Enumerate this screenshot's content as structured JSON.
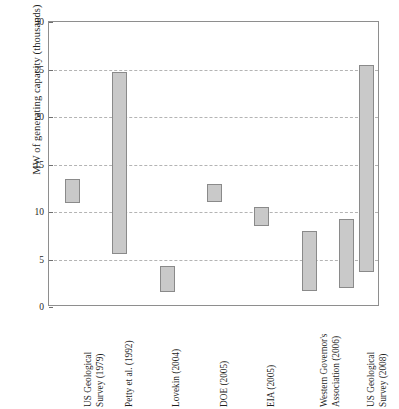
{
  "chart_data": {
    "type": "bar",
    "title": "",
    "xlabel": "",
    "ylabel": "MW of generating capacity (thousands)",
    "ylim": [
      0,
      30
    ],
    "yticks": [
      0,
      5,
      10,
      15,
      20,
      25,
      30
    ],
    "grid": true,
    "legend": "none",
    "note": "Floating range bars: each bar spans a low and high estimate.",
    "categories": [
      "US Geological Survey (1979)",
      "Petty et al. (1992)",
      "Lovekin (2004)",
      "DOE (2005)",
      "EIA (2005)",
      "Western Governor's Association (2006)",
      "US Geological Survey (2008)"
    ],
    "bars": [
      {
        "category": "US Geological Survey (1979)",
        "low": 11.0,
        "high": 13.5
      },
      {
        "category": "Petty et al. (1992)",
        "low": 5.6,
        "high": 24.7
      },
      {
        "category": "Lovekin (2004)",
        "low": 1.6,
        "high": 4.3
      },
      {
        "category": "DOE (2005)",
        "low": 11.1,
        "high": 13.0
      },
      {
        "category": "EIA (2005)",
        "low": 8.5,
        "high": 10.5
      },
      {
        "category": "Western Governor's Association (2006)",
        "low": 1.7,
        "high": 8.0
      },
      {
        "category": "US Geological Survey (2008)",
        "low": 2.0,
        "high": 9.3
      },
      {
        "category": "US Geological Survey (2008)",
        "low": 3.7,
        "high": 25.5
      }
    ],
    "lows": [
      11.0,
      5.6,
      1.6,
      11.1,
      8.5,
      1.7,
      2.0,
      3.7
    ],
    "highs": [
      13.5,
      24.7,
      4.3,
      13.0,
      10.5,
      8.0,
      9.3,
      25.5
    ]
  },
  "axis_labels": {
    "categories_wrapped": [
      {
        "line1": "US Geological",
        "line2": "Survey (1979)"
      },
      {
        "line1": "Petty et al. (1992)",
        "line2": ""
      },
      {
        "line1": "Lovekin (2004)",
        "line2": ""
      },
      {
        "line1": "DOE (2005)",
        "line2": ""
      },
      {
        "line1": "EIA (2005)",
        "line2": ""
      },
      {
        "line1": "Western Governor's",
        "line2": "Association (2006)"
      },
      {
        "line1": "US Geological",
        "line2": "Survey (2008)"
      }
    ],
    "ytick_labels": [
      "0",
      "5",
      "10",
      "15",
      "20",
      "25",
      "30"
    ]
  },
  "colors": {
    "bar_fill": "#c9c9c9",
    "bar_stroke": "#8a8a8a",
    "frame": "#8e8e8e",
    "grid": "#b4b4b4",
    "text": "#1f1f1f",
    "background": "#ffffff"
  }
}
